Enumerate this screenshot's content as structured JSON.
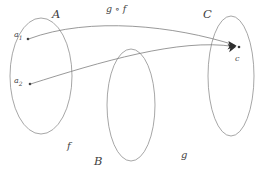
{
  "diagram": {
    "sets": [
      {
        "id": "A",
        "label": "A",
        "label_x": 52,
        "label_y": 9
      },
      {
        "id": "B",
        "label": "B",
        "label_x": 94,
        "label_y": 156
      },
      {
        "id": "C",
        "label": "C",
        "label_x": 203,
        "label_y": 9
      }
    ],
    "elements": [
      {
        "id": "a1",
        "label": "a",
        "sub": "1",
        "label_x": 14,
        "label_y": 31
      },
      {
        "id": "a2",
        "label": "a",
        "sub": "2",
        "label_x": 14,
        "label_y": 77
      },
      {
        "id": "c",
        "label": "c",
        "sub": "",
        "label_x": 235,
        "label_y": 55
      }
    ],
    "maps": [
      {
        "id": "f",
        "label": "f",
        "label_x": 67,
        "label_y": 141
      },
      {
        "id": "g",
        "label": "g",
        "label_x": 181,
        "label_y": 150
      }
    ],
    "composition": {
      "id": "gof",
      "label": "g ∘ f",
      "label_x": 106,
      "label_y": 4
    },
    "colors": {
      "stroke": "#8a8a8a",
      "arrow": "#6d6d6d",
      "text": "#4a4a4a",
      "background": "#ffffff"
    }
  }
}
